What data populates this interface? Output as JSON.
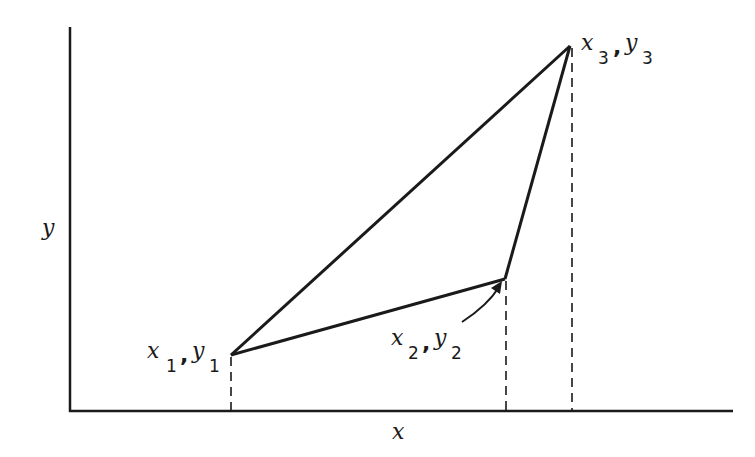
{
  "diagram": {
    "axes": {
      "x_label": "x",
      "y_label": "y"
    },
    "points": [
      {
        "name": "p1",
        "x_var": "x",
        "y_var": "y",
        "sub": "1",
        "sep": ",",
        "px": 231,
        "py": 355
      },
      {
        "name": "p2",
        "x_var": "x",
        "y_var": "y",
        "sub": "2",
        "sep": ",",
        "px": 505,
        "py": 279
      },
      {
        "name": "p3",
        "x_var": "x",
        "y_var": "y",
        "sub": "3",
        "sep": ",",
        "px": 570,
        "py": 46
      }
    ],
    "colors": {
      "line": "#1a1a1a",
      "background": "#ffffff"
    }
  }
}
